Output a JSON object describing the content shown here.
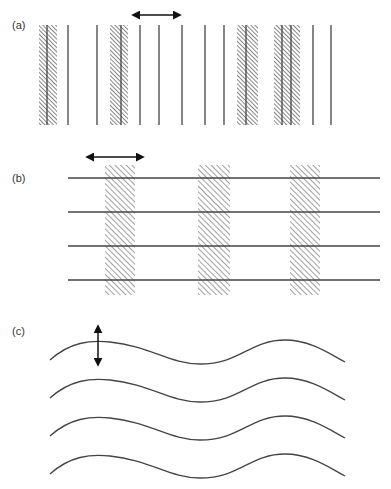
{
  "panels": [
    {
      "label": "(a)",
      "description": "Vertical lines with hatched shaded bands; horizontal double-headed arrow",
      "lines_x": [
        47,
        68,
        97,
        121,
        140,
        159,
        182,
        205,
        224,
        246,
        282,
        291,
        313,
        331
      ],
      "bands": [
        [
          39,
          57
        ],
        [
          110,
          128
        ],
        [
          237,
          258
        ],
        [
          274,
          300
        ]
      ],
      "y_range": [
        25,
        125
      ],
      "arrow": {
        "orientation": "horizontal",
        "x1": 133,
        "x2": 180,
        "y": 15
      }
    },
    {
      "label": "(b)",
      "description": "Horizontal lines crossed by vertical hatched bands; horizontal double-headed arrow",
      "lines_y": [
        178,
        212,
        246,
        280
      ],
      "x_range": [
        68,
        380
      ],
      "bands": [
        [
          105,
          135
        ],
        [
          198,
          230
        ],
        [
          290,
          320
        ]
      ],
      "band_y_range": [
        165,
        295
      ],
      "arrow": {
        "orientation": "horizontal",
        "x1": 87,
        "x2": 143,
        "y": 157
      }
    },
    {
      "label": "(c)",
      "description": "Four parallel wavy lines; vertical double-headed arrow",
      "wave_offsets_y": [
        0,
        38,
        76,
        114
      ],
      "x_range": [
        50,
        345
      ],
      "arrow": {
        "orientation": "vertical",
        "x": 98,
        "y1": 326,
        "y2": 365
      }
    }
  ],
  "colors": {
    "line": "#444444",
    "hatch": "#333333",
    "arrow": "#111111"
  }
}
